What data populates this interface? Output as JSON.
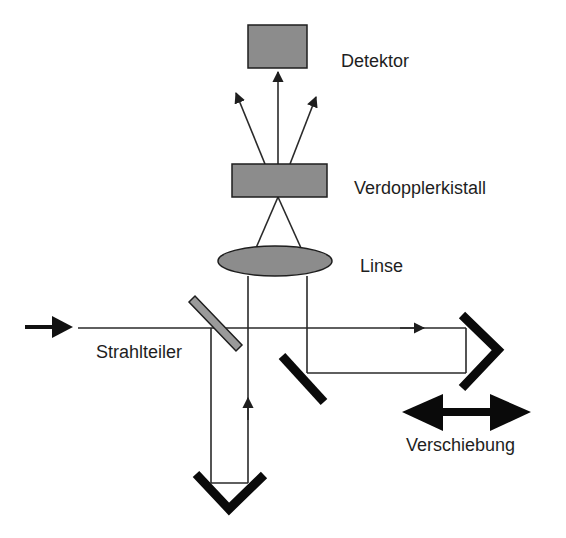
{
  "diagram": {
    "type": "optical-setup",
    "labels": {
      "detector": "Detektor",
      "crystal": "Verdopplerkistall",
      "lens": "Linse",
      "beamsplitter": "Strahlteiler",
      "translation": "Verschiebung"
    },
    "colors": {
      "component_fill": "#8c8c8c",
      "outline": "#1e1e1e",
      "mirror": "#0a0a0a",
      "beam": "#2a2a2a"
    }
  }
}
